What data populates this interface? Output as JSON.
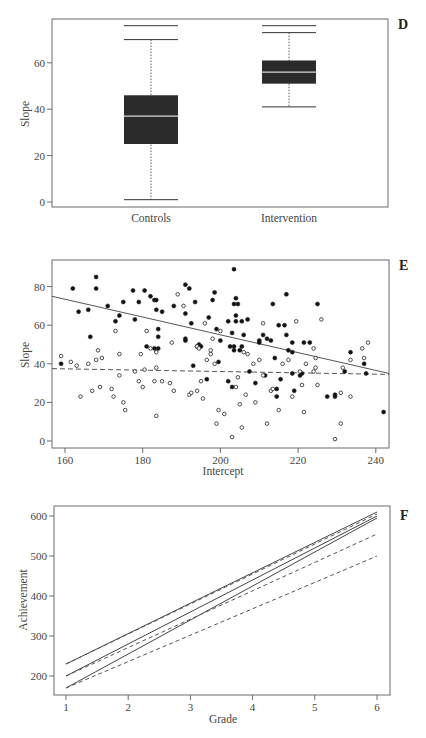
{
  "chart_data": [
    {
      "panel": "D",
      "type": "box",
      "title": "",
      "xlabel": "",
      "ylabel": "Slope",
      "ylim": [
        -2,
        78
      ],
      "yticks": [
        0,
        20,
        40,
        60
      ],
      "categories": [
        "Controls",
        "Intervention"
      ],
      "boxes": [
        {
          "name": "Controls",
          "top_line": 76,
          "whisker_high": 70,
          "q3": 46,
          "median": 37,
          "q1": 25,
          "whisker_low": 1
        },
        {
          "name": "Intervention",
          "top_line": 76,
          "whisker_high": 73,
          "q3": 61,
          "median": 56,
          "q1": 51,
          "whisker_low": 41
        }
      ]
    },
    {
      "panel": "E",
      "type": "scatter",
      "title": "",
      "xlabel": "Intercept",
      "ylabel": "Slope",
      "xlim": [
        157,
        243
      ],
      "ylim": [
        -4,
        94
      ],
      "xticks": [
        160,
        180,
        200,
        220,
        240
      ],
      "yticks": [
        0,
        20,
        40,
        60,
        80
      ],
      "series": [
        {
          "name": "filled",
          "marker": "filled-circle",
          "points": [
            [
              159,
              40
            ],
            [
              162,
              79
            ],
            [
              163.5,
              67
            ],
            [
              166,
              68
            ],
            [
              166.5,
              54
            ],
            [
              168,
              79
            ],
            [
              168,
              85
            ],
            [
              171,
              70
            ],
            [
              173,
              62
            ],
            [
              174,
              65
            ],
            [
              175,
              72
            ],
            [
              177.5,
              78
            ],
            [
              178,
              63
            ],
            [
              179,
              72
            ],
            [
              180.5,
              78
            ],
            [
              181,
              49
            ],
            [
              182,
              75
            ],
            [
              183,
              73
            ],
            [
              183.5,
              73
            ],
            [
              183.5,
              68
            ],
            [
              184,
              54
            ],
            [
              184,
              58
            ],
            [
              183,
              48
            ],
            [
              184,
              48
            ],
            [
              185,
              67
            ],
            [
              188,
              70
            ],
            [
              191,
              66
            ],
            [
              191,
              53
            ],
            [
              191,
              52
            ],
            [
              191,
              81
            ],
            [
              192,
              79
            ],
            [
              192.5,
              61
            ],
            [
              193,
              39
            ],
            [
              193.5,
              72
            ],
            [
              194,
              49
            ],
            [
              194.5,
              50
            ],
            [
              195,
              49
            ],
            [
              196.5,
              32
            ],
            [
              197,
              64
            ],
            [
              198,
              73
            ],
            [
              198.5,
              77
            ],
            [
              199.5,
              41
            ],
            [
              200,
              52
            ],
            [
              199,
              58
            ],
            [
              202,
              31
            ],
            [
              202,
              62
            ],
            [
              202.5,
              49
            ],
            [
              203,
              28
            ],
            [
              203,
              56
            ],
            [
              203.5,
              49
            ],
            [
              203.5,
              47
            ],
            [
              203.5,
              71
            ],
            [
              203.5,
              89
            ],
            [
              204,
              65
            ],
            [
              204,
              62
            ],
            [
              204,
              74
            ],
            [
              204.5,
              71
            ],
            [
              205,
              47
            ],
            [
              205.5,
              62
            ],
            [
              205.5,
              49
            ],
            [
              206,
              55
            ],
            [
              207,
              63
            ],
            [
              207.5,
              36
            ],
            [
              209,
              30
            ],
            [
              210,
              52
            ],
            [
              210,
              51
            ],
            [
              211,
              55
            ],
            [
              211.5,
              34
            ],
            [
              212,
              53
            ],
            [
              213,
              52
            ],
            [
              213.5,
              71
            ],
            [
              214,
              43
            ],
            [
              214.5,
              27
            ],
            [
              214.5,
              23
            ],
            [
              215,
              60
            ],
            [
              215.5,
              32
            ],
            [
              216.5,
              60
            ],
            [
              217,
              76
            ],
            [
              217,
              55
            ],
            [
              217.5,
              47
            ],
            [
              218.5,
              46
            ],
            [
              218.5,
              51
            ],
            [
              218.5,
              35
            ],
            [
              219,
              26
            ],
            [
              220.5,
              34
            ],
            [
              221,
              35
            ],
            [
              221.5,
              51
            ],
            [
              223,
              51
            ],
            [
              225,
              71
            ],
            [
              227.5,
              23
            ],
            [
              229.5,
              23
            ],
            [
              229.5,
              24
            ],
            [
              232,
              36
            ],
            [
              233.5,
              46
            ],
            [
              237,
              40
            ],
            [
              237.5,
              35
            ],
            [
              242,
              15
            ]
          ]
        },
        {
          "name": "open",
          "marker": "open-circle",
          "points": [
            [
              159,
              44
            ],
            [
              161.5,
              41
            ],
            [
              163,
              39
            ],
            [
              164,
              23
            ],
            [
              166,
              40
            ],
            [
              167,
              26
            ],
            [
              168,
              42
            ],
            [
              168.5,
              47
            ],
            [
              169,
              28
            ],
            [
              169.5,
              43
            ],
            [
              172,
              27
            ],
            [
              172.5,
              23
            ],
            [
              173,
              57
            ],
            [
              174,
              45
            ],
            [
              174,
              34
            ],
            [
              175,
              20
            ],
            [
              175.5,
              16
            ],
            [
              178,
              36
            ],
            [
              179,
              31
            ],
            [
              179.5,
              45
            ],
            [
              180,
              28
            ],
            [
              180.5,
              37
            ],
            [
              181,
              57
            ],
            [
              182,
              48
            ],
            [
              183,
              31
            ],
            [
              183.5,
              13
            ],
            [
              183.5,
              46
            ],
            [
              183.5,
              38
            ],
            [
              185,
              31
            ],
            [
              187,
              30
            ],
            [
              187.5,
              51
            ],
            [
              188,
              26
            ],
            [
              189,
              76
            ],
            [
              190.5,
              70
            ],
            [
              192,
              24
            ],
            [
              192.5,
              25
            ],
            [
              194,
              26
            ],
            [
              194,
              49
            ],
            [
              194.5,
              48
            ],
            [
              195,
              31
            ],
            [
              195.5,
              22
            ],
            [
              196,
              61
            ],
            [
              196.5,
              42
            ],
            [
              197.5,
              45
            ],
            [
              197.5,
              47
            ],
            [
              198,
              53
            ],
            [
              198.5,
              40
            ],
            [
              199,
              9
            ],
            [
              200,
              57
            ],
            [
              199.5,
              16
            ],
            [
              201,
              14
            ],
            [
              203,
              2
            ],
            [
              204,
              28
            ],
            [
              204.5,
              33
            ],
            [
              205,
              19
            ],
            [
              205.5,
              7
            ],
            [
              206,
              46
            ],
            [
              206.5,
              24
            ],
            [
              207,
              45
            ],
            [
              208.5,
              40
            ],
            [
              209,
              20
            ],
            [
              210,
              42
            ],
            [
              211,
              34
            ],
            [
              211,
              61
            ],
            [
              212,
              9
            ],
            [
              213,
              26
            ],
            [
              213.5,
              27
            ],
            [
              215,
              16
            ],
            [
              216,
              40
            ],
            [
              217.5,
              42
            ],
            [
              218.5,
              23
            ],
            [
              219.5,
              62
            ],
            [
              220.5,
              36
            ],
            [
              221,
              29
            ],
            [
              221.5,
              15
            ],
            [
              222,
              40
            ],
            [
              224,
              48
            ],
            [
              224,
              36
            ],
            [
              224.5,
              38
            ],
            [
              224.5,
              43
            ],
            [
              225,
              29
            ],
            [
              226,
              63
            ],
            [
              229.5,
              1
            ],
            [
              231,
              9
            ],
            [
              231,
              25
            ],
            [
              231.5,
              38
            ],
            [
              233.5,
              23
            ],
            [
              233.5,
              42
            ],
            [
              236.5,
              48
            ],
            [
              237,
              43
            ],
            [
              238,
              51
            ]
          ]
        }
      ],
      "fit_lines": [
        {
          "name": "solid-fit",
          "style": "solid",
          "x": [
            157,
            243
          ],
          "y": [
            75,
            35
          ]
        },
        {
          "name": "dashed-fit",
          "style": "dashed",
          "x": [
            157,
            243
          ],
          "y": [
            37.5,
            34.5
          ]
        }
      ]
    },
    {
      "panel": "F",
      "type": "line",
      "title": "",
      "xlabel": "Grade",
      "ylabel": "Achievement",
      "xlim": [
        0.8,
        6.2
      ],
      "ylim": [
        152,
        622
      ],
      "xticks": [
        1,
        2,
        3,
        4,
        5,
        6
      ],
      "yticks": [
        200,
        300,
        400,
        500,
        600
      ],
      "x": [
        1,
        6
      ],
      "series": [
        {
          "name": "solid-1",
          "style": "solid",
          "values": [
            230,
            610
          ]
        },
        {
          "name": "solid-2",
          "style": "solid",
          "values": [
            200,
            600
          ]
        },
        {
          "name": "solid-3",
          "style": "solid",
          "values": [
            170,
            595
          ]
        },
        {
          "name": "dashed-1",
          "style": "dashed",
          "values": [
            230,
            605
          ]
        },
        {
          "name": "dashed-2",
          "style": "dashed",
          "values": [
            200,
            555
          ]
        },
        {
          "name": "dashed-3",
          "style": "dashed",
          "values": [
            170,
            500
          ]
        }
      ]
    }
  ],
  "panels": {
    "d": {
      "letter": "D",
      "ylabel": "Slope",
      "yticks": [
        "0",
        "20",
        "40",
        "60"
      ],
      "categories": [
        "Controls",
        "Intervention"
      ]
    },
    "e": {
      "letter": "E",
      "ylabel": "Slope",
      "xlabel": "Intercept",
      "yticks": [
        "0",
        "20",
        "40",
        "60",
        "80"
      ],
      "xticks": [
        "160",
        "180",
        "200",
        "220",
        "240"
      ]
    },
    "f": {
      "letter": "F",
      "ylabel": "Achievement",
      "xlabel": "Grade",
      "yticks": [
        "200",
        "300",
        "400",
        "500",
        "600"
      ],
      "xticks": [
        "1",
        "2",
        "3",
        "4",
        "5",
        "6"
      ]
    }
  },
  "colors": {
    "frame": "#6b6b6b",
    "box_fill": "#2b2b2b",
    "median": "#d8d8d8",
    "ink": "#333333",
    "text": "#444444"
  }
}
